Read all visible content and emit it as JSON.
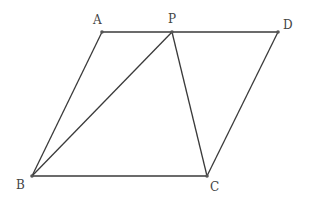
{
  "diagram": {
    "type": "geometry-figure",
    "points": {
      "A": {
        "label": "A",
        "x": 102,
        "y": 32,
        "lx": 93,
        "ly": 24
      },
      "P": {
        "label": "P",
        "x": 172,
        "y": 32,
        "lx": 168,
        "ly": 23
      },
      "D": {
        "label": "D",
        "x": 278,
        "y": 32,
        "lx": 283,
        "ly": 29
      },
      "B": {
        "label": "B",
        "x": 32,
        "y": 176,
        "lx": 16,
        "ly": 189
      },
      "C": {
        "label": "C",
        "x": 207,
        "y": 176,
        "lx": 210,
        "ly": 191
      }
    },
    "segments": [
      [
        "A",
        "P"
      ],
      [
        "P",
        "D"
      ],
      [
        "A",
        "B"
      ],
      [
        "B",
        "C"
      ],
      [
        "C",
        "D"
      ],
      [
        "P",
        "B"
      ],
      [
        "P",
        "C"
      ]
    ],
    "line_color": "#3a3a3a"
  }
}
